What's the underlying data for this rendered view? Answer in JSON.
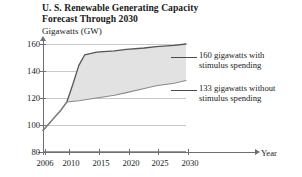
{
  "chart_data": {
    "type": "area",
    "title": "U. S. Renewable Generating Capacity Forecast Through 2030",
    "title_lines": [
      "U. S. Renewable Generating Capacity",
      "Forecast Through 2030"
    ],
    "ylabel": "Gigawatts (GW)",
    "xlabel": "Year",
    "ylim": [
      80,
      160
    ],
    "xlim": [
      2006,
      2030
    ],
    "yticks": [
      80,
      100,
      120,
      140,
      160
    ],
    "ytick_labels": [
      "80",
      "100",
      "120",
      "140",
      "160"
    ],
    "xticks": [
      2006,
      2010,
      2015,
      2020,
      2025,
      2030
    ],
    "xtick_labels": [
      "2006",
      "2010",
      "2015",
      "2020",
      "2025",
      "2030"
    ],
    "grid": true,
    "legend_position": "right-annotations",
    "fill_color": "#e2e2e2",
    "line_color": "#555555",
    "grid_color": "#c9c9c9",
    "axis_color": "#6f6f6f",
    "series": [
      {
        "name": "With stimulus spending",
        "end_value": 160,
        "end_label": "160 gigawatts with stimulus spending",
        "x": [
          2006,
          2007,
          2008,
          2009,
          2010,
          2011,
          2012,
          2013,
          2015,
          2018,
          2020,
          2023,
          2025,
          2028,
          2030
        ],
        "values": [
          96,
          101,
          106,
          111,
          117,
          130,
          144,
          152,
          154,
          155,
          156,
          157,
          158,
          159,
          160
        ]
      },
      {
        "name": "Without stimulus spending",
        "end_value": 133,
        "end_label": "133 gigawatts without stimulus spending",
        "x": [
          2006,
          2007,
          2008,
          2009,
          2010,
          2012,
          2015,
          2018,
          2020,
          2023,
          2025,
          2028,
          2030
        ],
        "values": [
          96,
          101,
          106,
          111,
          117,
          118,
          120,
          122,
          124,
          127,
          129,
          131,
          133
        ]
      }
    ],
    "annotations": [
      {
        "name": "with-stimulus-callout",
        "lines": [
          "160 gigawatts with",
          "stimulus spending"
        ],
        "value": 160
      },
      {
        "name": "without-stimulus-callout",
        "lines": [
          "133 gigawatts without",
          "stimulus spending"
        ],
        "value": 133
      }
    ]
  }
}
